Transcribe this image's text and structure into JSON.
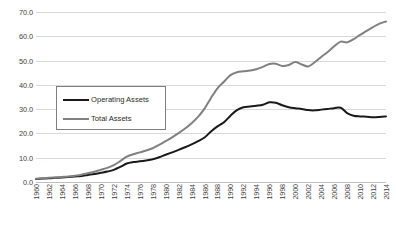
{
  "chart_data": {
    "type": "line",
    "title": "",
    "xlabel": "",
    "ylabel": "",
    "ylim": [
      0.0,
      70.0
    ],
    "ytick_step": 10.0,
    "yticks": [
      "0.0",
      "10.0",
      "20.0",
      "30.0",
      "40.0",
      "50.0",
      "60.0",
      "70.0"
    ],
    "grid": true,
    "legend_position": "upper-left-inset",
    "x": [
      1960,
      1961,
      1962,
      1963,
      1964,
      1965,
      1966,
      1967,
      1968,
      1969,
      1970,
      1971,
      1972,
      1973,
      1974,
      1975,
      1976,
      1977,
      1978,
      1979,
      1980,
      1981,
      1982,
      1983,
      1984,
      1985,
      1986,
      1987,
      1988,
      1989,
      1990,
      1991,
      1992,
      1993,
      1994,
      1995,
      1996,
      1997,
      1998,
      1999,
      2000,
      2001,
      2002,
      2003,
      2004,
      2005,
      2006,
      2007,
      2008,
      2009,
      2010,
      2011,
      2012,
      2013,
      2014
    ],
    "xticks": [
      "1960",
      "1962",
      "1964",
      "1966",
      "1968",
      "1970",
      "1972",
      "1974",
      "1976",
      "1978",
      "1980",
      "1982",
      "1984",
      "1986",
      "1988",
      "1990",
      "1992",
      "1994",
      "1996",
      "1998",
      "2000",
      "2002",
      "2004",
      "2006",
      "2008",
      "2010",
      "2012",
      "2014"
    ],
    "xlim": [
      1960,
      2014
    ],
    "series": [
      {
        "name": "Operating Assets",
        "color": "#1a1a1a",
        "values": [
          1.2,
          1.4,
          1.5,
          1.7,
          1.9,
          2.1,
          2.3,
          2.5,
          2.9,
          3.3,
          3.8,
          4.3,
          5.0,
          6.2,
          7.6,
          8.2,
          8.5,
          8.9,
          9.4,
          10.2,
          11.2,
          12.2,
          13.2,
          14.3,
          15.5,
          16.8,
          18.3,
          20.8,
          22.9,
          24.6,
          27.3,
          29.6,
          30.8,
          31.1,
          31.4,
          31.8,
          32.8,
          32.6,
          31.6,
          30.8,
          30.4,
          30.1,
          29.6,
          29.5,
          29.8,
          30.1,
          30.4,
          30.6,
          28.4,
          27.3,
          27.0,
          26.9,
          26.7,
          26.8,
          27.0
        ]
      },
      {
        "name": "Total Assets",
        "color": "#808080",
        "values": [
          1.3,
          1.5,
          1.7,
          1.9,
          2.1,
          2.3,
          2.6,
          3.0,
          3.6,
          4.2,
          5.0,
          5.8,
          6.9,
          8.6,
          10.4,
          11.4,
          12.2,
          13.0,
          13.9,
          15.3,
          16.8,
          18.4,
          20.1,
          22.0,
          24.2,
          26.8,
          30.2,
          34.6,
          38.6,
          41.3,
          44.0,
          45.2,
          45.6,
          45.9,
          46.4,
          47.4,
          48.6,
          48.7,
          47.8,
          48.2,
          49.4,
          48.4,
          47.6,
          49.3,
          51.5,
          53.5,
          55.9,
          57.8,
          57.5,
          58.8,
          60.6,
          62.2,
          63.8,
          65.2,
          66.1
        ]
      }
    ]
  },
  "legend": {
    "items": [
      {
        "label": "Operating Assets",
        "color": "#1a1a1a"
      },
      {
        "label": "Total Assets",
        "color": "#808080"
      }
    ]
  }
}
